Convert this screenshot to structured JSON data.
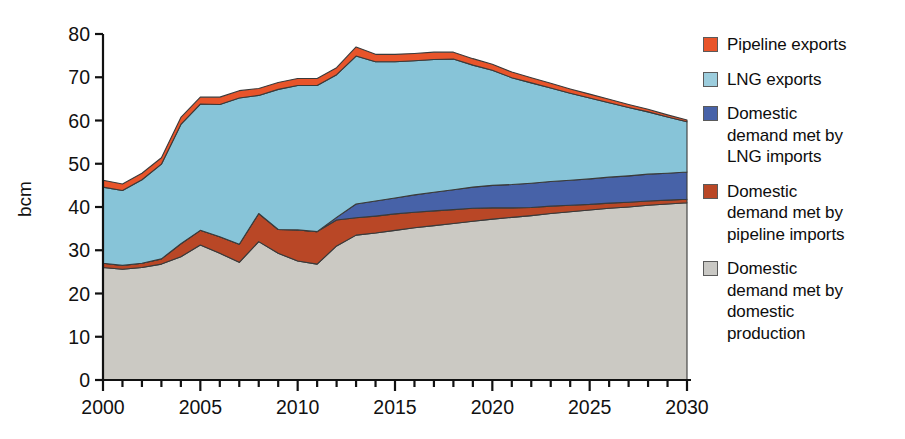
{
  "chart_data": {
    "type": "area",
    "stacked": true,
    "title": "",
    "xlabel": "",
    "ylabel": "bcm",
    "xlim": [
      2000,
      2030
    ],
    "ylim": [
      0,
      80
    ],
    "yticks": [
      0,
      10,
      20,
      30,
      40,
      50,
      60,
      70,
      80
    ],
    "xticks_major": [
      2000,
      2005,
      2010,
      2015,
      2020,
      2025,
      2030
    ],
    "xticks_minor_step": 1,
    "grid": false,
    "legend_position": "right",
    "x": [
      2000,
      2001,
      2002,
      2003,
      2004,
      2005,
      2006,
      2007,
      2008,
      2009,
      2010,
      2011,
      2012,
      2013,
      2014,
      2015,
      2016,
      2017,
      2018,
      2019,
      2020,
      2021,
      2022,
      2023,
      2024,
      2025,
      2026,
      2027,
      2028,
      2029,
      2030
    ],
    "series": [
      {
        "name": "Domestic demand met by domestic production",
        "color": "#cbc9c3",
        "values": [
          26.0,
          25.6,
          26.0,
          26.8,
          28.5,
          31.2,
          29.3,
          27.2,
          32.0,
          29.3,
          27.5,
          26.8,
          31.0,
          33.5,
          34.0,
          34.6,
          35.2,
          35.7,
          36.2,
          36.7,
          37.2,
          37.6,
          38.0,
          38.5,
          38.9,
          39.3,
          39.7,
          40.0,
          40.4,
          40.7,
          41.0
        ]
      },
      {
        "name": "Domestic demand met by pipeline imports",
        "color": "#b94726",
        "values": [
          1.0,
          0.9,
          1.0,
          1.2,
          3.0,
          3.4,
          3.8,
          4.2,
          6.5,
          5.5,
          7.2,
          7.5,
          6.0,
          4.0,
          3.9,
          3.8,
          3.6,
          3.4,
          3.2,
          3.0,
          2.6,
          2.2,
          1.9,
          1.7,
          1.5,
          1.3,
          1.2,
          1.1,
          1.0,
          0.9,
          0.8
        ]
      },
      {
        "name": "Domestic demand met by LNG imports",
        "color": "#4762a8",
        "values": [
          0.0,
          0.0,
          0.0,
          0.0,
          0.0,
          0.0,
          0.0,
          0.0,
          0.0,
          0.0,
          0.0,
          0.0,
          0.6,
          3.2,
          3.5,
          3.7,
          4.0,
          4.3,
          4.6,
          4.9,
          5.2,
          5.4,
          5.6,
          5.7,
          5.8,
          5.9,
          6.0,
          6.1,
          6.2,
          6.2,
          6.3
        ]
      },
      {
        "name": "LNG exports",
        "color": "#87c4d8",
        "values": [
          17.6,
          17.3,
          19.3,
          21.9,
          27.6,
          29.2,
          30.6,
          33.8,
          27.3,
          32.4,
          33.4,
          33.8,
          33.0,
          34.2,
          32.2,
          31.5,
          31.0,
          30.7,
          30.2,
          28.2,
          26.6,
          24.7,
          23.2,
          21.6,
          20.1,
          18.7,
          17.2,
          15.8,
          14.4,
          13.0,
          11.6
        ]
      },
      {
        "name": "Pipeline exports",
        "color": "#e8542a",
        "values": [
          1.6,
          1.5,
          1.5,
          1.5,
          1.6,
          1.6,
          1.7,
          1.7,
          1.6,
          1.6,
          1.6,
          1.6,
          1.6,
          2.1,
          1.7,
          1.7,
          1.7,
          1.7,
          1.6,
          1.5,
          1.4,
          1.3,
          1.2,
          1.1,
          1.0,
          0.9,
          0.8,
          0.7,
          0.6,
          0.5,
          0.4
        ]
      }
    ],
    "totals": [
      46.2,
      45.3,
      47.8,
      51.4,
      60.7,
      65.4,
      65.4,
      66.9,
      67.4,
      68.8,
      69.7,
      69.7,
      72.2,
      77.0,
      75.3,
      75.3,
      75.5,
      75.8,
      75.8,
      74.3,
      73.0,
      71.2,
      69.9,
      68.6,
      67.3,
      66.1,
      64.9,
      63.7,
      62.6,
      61.3,
      60.1
    ]
  },
  "axes": {
    "ylabel": "bcm",
    "ytick_labels": [
      "0",
      "10",
      "20",
      "30",
      "40",
      "50",
      "60",
      "70",
      "80"
    ],
    "xtick_labels": [
      "2000",
      "2005",
      "2010",
      "2015",
      "2020",
      "2025",
      "2030"
    ]
  },
  "legend": {
    "items": [
      {
        "label": "Pipeline exports",
        "color": "#e8542a"
      },
      {
        "label": "LNG exports",
        "color": "#9ccddd"
      },
      {
        "label": "Domestic\ndemand met by\nLNG imports",
        "color": "#4762a8"
      },
      {
        "label": "Domestic\ndemand met by\npipeline imports",
        "color": "#b94726"
      },
      {
        "label": "Domestic\ndemand met by\ndomestic\nproduction",
        "color": "#c9c8c4"
      }
    ]
  }
}
